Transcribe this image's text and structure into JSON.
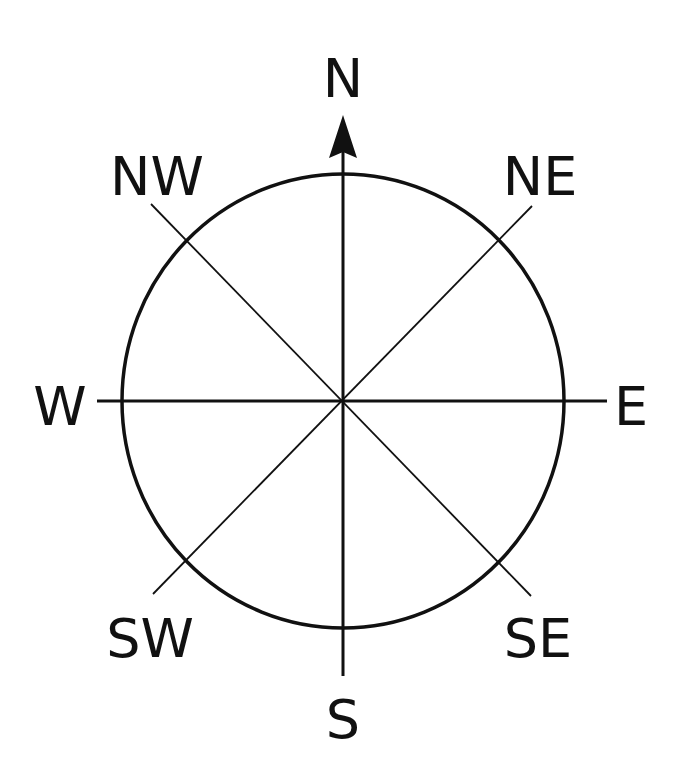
{
  "diagram": {
    "type": "compass-rose",
    "center": {
      "x": 343,
      "y": 401
    },
    "circle": {
      "rx": 221,
      "ry": 227
    },
    "labels": {
      "n": "N",
      "ne": "NE",
      "e": "E",
      "se": "SE",
      "s": "S",
      "sw": "SW",
      "w": "W",
      "nw": "NW"
    },
    "colors": {
      "stroke": "#111111",
      "background": "#ffffff"
    }
  }
}
